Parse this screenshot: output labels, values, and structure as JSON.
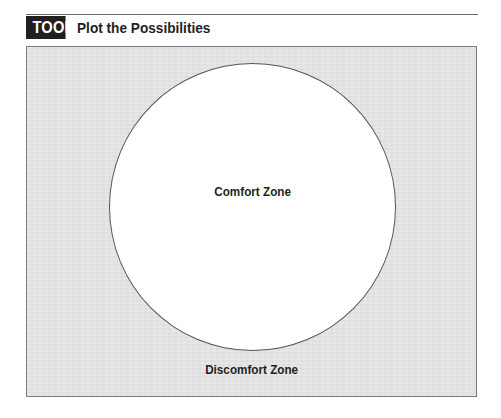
{
  "header": {
    "badge": "TOOL",
    "title": "Plot the Possibilities"
  },
  "diagram": {
    "inner_zone_label": "Comfort Zone",
    "outer_zone_label": "Discomfort Zone",
    "colors": {
      "badge_bg": "#231f20",
      "badge_text": "#ffffff",
      "outer_zone_fill": "#e5e5e5",
      "inner_zone_fill": "#ffffff",
      "outline": "#555555",
      "text": "#231f20"
    }
  }
}
